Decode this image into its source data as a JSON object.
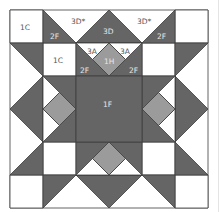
{
  "diagram": {
    "colors": {
      "dark": "#656565",
      "medium": "#9b9b9b",
      "light": "#ffffff",
      "line": "#3d3d3d",
      "label_on_light": "#555555",
      "label_on_dark": "#e6e6e6"
    },
    "grid": {
      "rows": 6,
      "cols": 6
    },
    "labels": {
      "c1_topleft": "1C",
      "c1_inner": "1C",
      "f2_top_left": "2F",
      "d3star_left": "3D*",
      "d3_center": "3D",
      "d3star_right": "3D*",
      "f2_top_right": "2F",
      "a3_left": "3A",
      "a3_right": "3A",
      "h1": "1H",
      "f2_inner_left": "2F",
      "f2_inner_right": "2F",
      "f1_center": "1F"
    }
  }
}
